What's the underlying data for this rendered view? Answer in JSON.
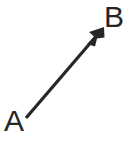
{
  "figure": {
    "type": "vector-diagram",
    "background_color": "#ffffff",
    "width": 128,
    "height": 147,
    "stroke_color": "#262626",
    "stroke_width": 3.2
  },
  "labels": {
    "start_point": "A",
    "end_point": "B"
  },
  "vector": {
    "name": "arrow-a-to-b",
    "tail": {
      "x": 26,
      "y": 118
    },
    "tip": {
      "x": 104,
      "y": 27
    },
    "direction": "up-right",
    "arrowhead": {
      "style": "filled-triangle-barbed",
      "length": 17,
      "width": 13
    }
  }
}
